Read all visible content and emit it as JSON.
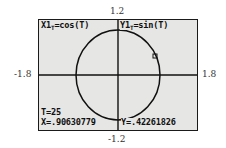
{
  "window": {
    "ymax_label": "1.2",
    "ymin_label": "-1.2",
    "xmin_label": "-1.8",
    "xmax_label": "1.8",
    "xmin": -1.8,
    "xmax": 1.8,
    "ymin": -1.2,
    "ymax": 1.2
  },
  "equations": {
    "x_lhs": "X1",
    "x_sub": "T",
    "x_rhs": "=cos(T)",
    "y_lhs": "Y1",
    "y_sub": "T",
    "y_rhs": "=sin(T)"
  },
  "trace": {
    "t_readout": "T=25",
    "x_readout": "X=.90630779",
    "y_readout": "Y=.42261826",
    "t_value": 25,
    "x_value": 0.90630779,
    "y_value": 0.42261826
  },
  "graph": {
    "curve": "unit circle",
    "cursor_icon": "trace-cursor-icon"
  },
  "colors": {
    "lcd_background": "#e6e6e4",
    "ink": "#111111",
    "frame": "#1a1a1a"
  }
}
